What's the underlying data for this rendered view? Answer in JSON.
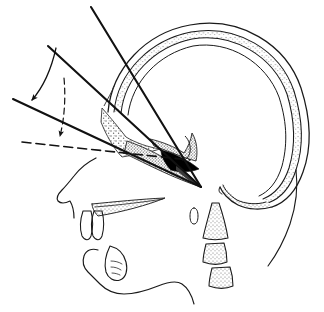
{
  "figure": {
    "type": "anatomical-line-drawing",
    "background_color": "#ffffff",
    "ink_color": "#1a1a1a",
    "stipple_color": "#6b6b6b",
    "fill_black": "#000000",
    "width": 324,
    "height": 312
  },
  "structures": {
    "cranial_vault": {
      "name": "Cranial vault (outer table, diploe, inner table)",
      "outer_table": "M 108 112 C 112 68 146 33 190 25 C 240 16 286 44 301 88 C 312 122 311 150 303 172 C 296 192 284 203 272 207",
      "diploe_outer": "M 114 112 C 118 72 150 40 191 32 C 237 24 280 50 294 91 C 304 123 303 149 296 170 C 290 189 279 199 268 203",
      "diploe_inner": "M 121 113 C 125 77 154 47 192 39 C 233 32 273 56 287 94 C 296 124 295 148 289 168 C 283 186 273 195 263 199",
      "inner_table": "M 128 115 C 132 82 158 54 193 46 C 229 40 266 62 279 97 C 288 125 287 147 282 166 C 277 183 268 192 259 196",
      "occipital_tail": "M 272 207 C 262 210 248 210 238 205 C 228 200 222 193 220 188",
      "occipital_tail_inner": "M 263 199 C 254 202 243 202 235 198 C 228 194 224 189 222 185",
      "neck_contour": "M 296 170 C 298 186 296 206 290 224 C 283 244 274 258 268 266"
    },
    "sella_sphenoid": {
      "name": "Sella turcica / sphenoid stippled region",
      "stipple_path": "M 104 110 C 112 118 120 128 126 136 C 134 142 146 146 158 148 C 148 152 134 154 124 156 C 116 150 108 136 104 124 Z",
      "clivus_path": "M 152 140 C 162 142 172 146 180 150 C 186 144 190 138 192 132 C 196 140 196 150 194 158 C 184 156 170 150 158 146 Z",
      "black_wedge": "M 160 150 C 172 152 186 158 196 166 C 190 170 180 172 170 170 C 164 164 160 156 160 150 Z",
      "hatch_wedge": "M 128 140 C 146 146 172 156 200 186 C 176 178 148 164 126 152 Z"
    },
    "face": {
      "name": "Facial soft tissue and maxilla",
      "nose_profile": "M 96 158 C 88 162 80 168 74 176 C 70 181 66 186 62 190 C 58 194 56 198 58 201 C 61 204 66 203 70 201 C 73 206 74 212 74 218",
      "upper_lip": "M 74 218 C 76 224 78 230 80 234 C 82 238 86 240 90 238 C 93 236 95 232 96 228",
      "incisor_upper_1": "M 82 212 C 80 220 80 230 82 236 C 85 240 88 240 90 236 C 92 230 92 220 90 212 Z",
      "incisor_upper_2": "M 93 212 C 91 220 91 230 93 236 C 96 240 99 240 101 236 C 103 230 103 220 101 212 Z",
      "palate": "M 92 205 C 112 203 140 200 164 199 C 148 206 122 212 98 216 C 94 212 92 208 92 205 Z",
      "palate_line": "M 94 207 C 118 205 144 202 162 200"
    },
    "mandible": {
      "name": "Mandible with lower lip and chin",
      "outline": "M 98 250 C 92 248 86 250 84 256 C 82 262 84 268 88 272 C 92 276 96 280 100 284 C 106 290 114 294 124 294 C 136 294 148 290 158 286 C 168 282 176 280 182 284 C 188 288 192 296 194 304",
      "lower_incisor": "M 110 246 C 106 254 104 264 106 272 C 108 278 114 282 120 280 C 126 278 128 270 126 262 C 124 254 118 248 110 246 Z",
      "incisor_detail_1": "M 112 262 C 116 262 120 263 122 265",
      "incisor_detail_2": "M 112 268 C 116 268 119 269 121 271",
      "incisor_detail_3": "M 113 274 C 116 274 118 275 120 276"
    },
    "cervical_spine": {
      "name": "Cervical vertebrae",
      "atlas_oval": "M 194 208 C 191 208 190 212 190 216 C 190 220 191 224 194 224 C 197 224 198 220 198 216 C 198 212 197 208 194 208 Z",
      "axis_body": "M 212 203 C 209 215 205 228 203 238 C 210 240 220 240 228 238 C 226 226 222 212 219 203 Z",
      "c3_body": "M 206 244 C 204 252 203 258 203 262 C 211 265 220 265 227 262 C 227 256 226 249 224 243 Z",
      "c4_body": "M 212 268 C 210 276 209 282 209 286 C 217 289 226 289 233 286 C 233 280 232 273 230 267 Z"
    }
  },
  "measurement_lines": {
    "line_upper_steep": {
      "name": "Upper steep reference line (anterior cranial base)",
      "x1": 91,
      "y1": 7,
      "x2": 201,
      "y2": 187,
      "style": "solid",
      "width": 2.1
    },
    "line_nasion_ray": {
      "name": "Nasion reference ray",
      "x1": 48,
      "y1": 46,
      "x2": 201,
      "y2": 187,
      "style": "solid",
      "width": 2.1
    },
    "line_horizontal_lower": {
      "name": "Lower solid reference line (Frankfort-type plane)",
      "x1": 13,
      "y1": 99,
      "x2": 201,
      "y2": 187,
      "style": "solid",
      "width": 2.1
    },
    "line_dashed_plane": {
      "name": "Dashed horizontal reference plane",
      "x1": 22,
      "y1": 142,
      "x2": 190,
      "y2": 160,
      "style": "dashed",
      "width": 1.6,
      "dash_pattern": "9,5"
    }
  },
  "angle_markers": {
    "outer_arc": {
      "name": "Outer angle arc with arrowhead",
      "arc_path": "M 56 48 C 52 66 46 84 32 100",
      "style": "solid",
      "arrow_at": {
        "x": 31,
        "y": 101,
        "angle": 128
      }
    },
    "inner_arc": {
      "name": "Inner dashed angle arc with arrowhead",
      "arc_path": "M 64 78 C 66 100 64 120 60 136",
      "style": "dashed",
      "dash_pattern": "6,4",
      "arrow_at": {
        "x": 60,
        "y": 138,
        "angle": 100
      }
    },
    "arrowhead_fill": "#111111"
  },
  "landmarks": {
    "apex_point": {
      "name": "convergence-apex",
      "x": 201,
      "y": 187
    },
    "sella_point": {
      "name": "sella-crossing",
      "x": 100,
      "y": 147
    }
  }
}
